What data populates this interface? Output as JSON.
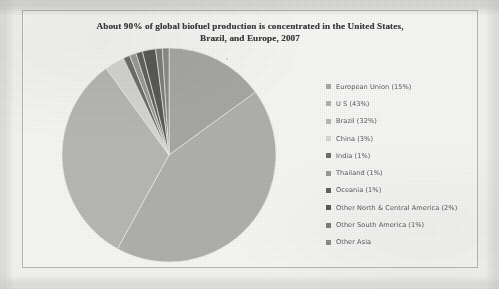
{
  "document": {
    "kind": "scanned-chart-page",
    "background_color": "#f4f4f2",
    "frame_color": "#b9b9b7"
  },
  "chart_data": {
    "type": "pie",
    "title": "About 90% of global biofuel production is concentrated in the United States, Brazil, and Europe, 2007",
    "title_line_1": "About 90% of global biofuel production is concentrated in the United States,",
    "title_line_2": "Brazil, and Europe, 2007",
    "xlabel": "",
    "ylabel": "",
    "legend_position": "right",
    "grid": false,
    "start_angle_deg": 0,
    "direction": "clockwise",
    "categories": [
      "European Union",
      "U S",
      "Brazil",
      "China",
      "India",
      "Thailand",
      "Oceania",
      "Other North & Central America",
      "Other South America",
      "Other Asia"
    ],
    "values": [
      15,
      43,
      32,
      3,
      1,
      1,
      1,
      2,
      1,
      1
    ],
    "value_unit": "percent",
    "labels": [
      "European Union (15%)",
      "U S (43%)",
      "Brazil (32%)",
      "China (3%)",
      "India (1%)",
      "Thailand (1%)",
      "Oceania (1%)",
      "Other North & Central America (2%)",
      "Other South America (1%)",
      "Other Asia"
    ],
    "colors": [
      "#a8a8a6",
      "#b0b0ae",
      "#b8b8b6",
      "#d6d6d4",
      "#6e6e6c",
      "#9a9a98",
      "#636361",
      "#5a5a58",
      "#7e7e7c",
      "#8c8c8a"
    ]
  },
  "legend": {
    "items": [
      {
        "label": "European Union (15%)",
        "color": "#a8a8a6"
      },
      {
        "label": "U S (43%)",
        "color": "#b0b0ae"
      },
      {
        "label": "Brazil (32%)",
        "color": "#b8b8b6"
      },
      {
        "label": "China (3%)",
        "color": "#d6d6d4"
      },
      {
        "label": "India (1%)",
        "color": "#6e6e6c"
      },
      {
        "label": "Thailand (1%)",
        "color": "#9a9a98"
      },
      {
        "label": "Oceania (1%)",
        "color": "#636361"
      },
      {
        "label": "Other North & Central America (2%)",
        "color": "#5a5a58"
      },
      {
        "label": "Other South America (1%)",
        "color": "#7e7e7c"
      },
      {
        "label": "Other Asia",
        "color": "#8c8c8a"
      }
    ]
  }
}
